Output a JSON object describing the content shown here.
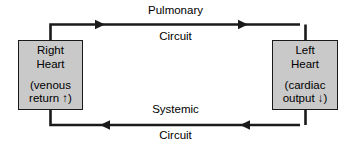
{
  "diagram": {
    "colors": {
      "box_fill": "#c9c9c9",
      "line": "#1a1a1a",
      "text": "#000000",
      "background": "#ffffff"
    },
    "boxes": [
      {
        "id": "right-heart",
        "title_line1": "Right",
        "title_line2": "Heart",
        "note_line1": "(venous",
        "note_line2": "return ↑)"
      },
      {
        "id": "left-heart",
        "title_line1": "Left",
        "title_line2": "Heart",
        "note_line1": "(cardiac",
        "note_line2": "output ↓)"
      }
    ],
    "labels": {
      "top_name": "Pulmonary",
      "top_circuit": "Circuit",
      "bottom_name": "Systemic",
      "bottom_circuit": "Circuit"
    },
    "flow": {
      "top_direction": "right",
      "bottom_direction": "left",
      "arrowheads": 4
    }
  }
}
